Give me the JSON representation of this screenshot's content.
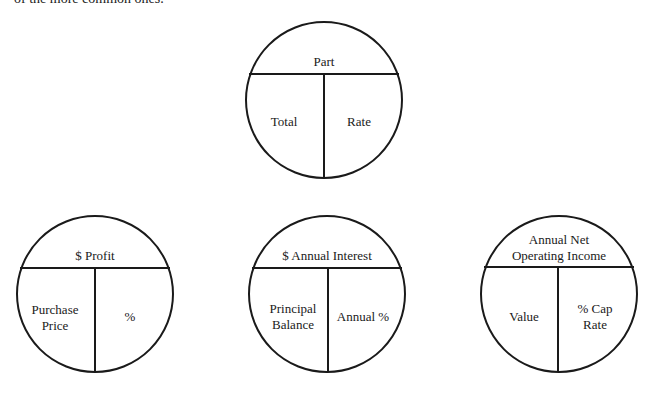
{
  "intro_text": "of the more common ones.",
  "diagrams": [
    {
      "id": "generic",
      "top": [
        "Part"
      ],
      "left": [
        "Total"
      ],
      "right": [
        "Rate"
      ]
    },
    {
      "id": "profit",
      "top": [
        "$ Profit"
      ],
      "left": [
        "Purchase",
        "Price"
      ],
      "right": [
        "%"
      ]
    },
    {
      "id": "interest",
      "top": [
        "$ Annual Interest"
      ],
      "left": [
        "Principal",
        "Balance"
      ],
      "right": [
        "Annual %"
      ]
    },
    {
      "id": "cap-rate",
      "top": [
        "Annual Net",
        "Operating Income"
      ],
      "left": [
        "Value"
      ],
      "right": [
        "% Cap",
        "Rate"
      ]
    }
  ],
  "colors": {
    "stroke": "#1a1a1a",
    "background": "#ffffff"
  }
}
